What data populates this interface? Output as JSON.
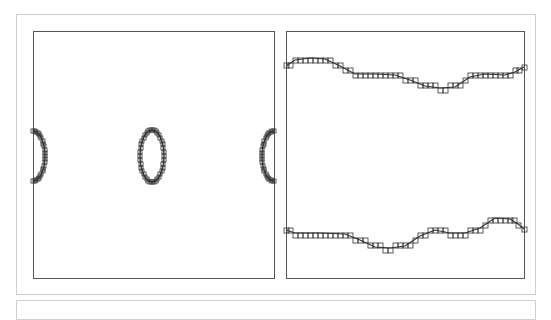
{
  "figure": {
    "panels": [
      {
        "id": "left",
        "description": "Contour panel showing closed cell-boundary outlines: a central ellipse and two half-arcs at the periodic left/right edges",
        "shapes": [
          {
            "type": "ellipse",
            "cx": 152,
            "cy": 156,
            "rx": 12,
            "ry": 26
          },
          {
            "type": "half-arc-left-edge",
            "x_edge": 33,
            "bulge_x": 45,
            "y_top": 131,
            "y_bottom": 181
          },
          {
            "type": "half-arc-right-edge",
            "x_edge": 274,
            "bulge_x": 262,
            "y_top": 131,
            "y_bottom": 181
          }
        ]
      },
      {
        "id": "right",
        "description": "Contour panel showing two wavy interface curves traced by staircase grid cells",
        "curves": [
          {
            "name": "upper-interface",
            "points": [
              [
                286,
                66
              ],
              [
                295,
                60
              ],
              [
                310,
                58
              ],
              [
                325,
                59
              ],
              [
                340,
                66
              ],
              [
                355,
                74
              ],
              [
                375,
                74
              ],
              [
                395,
                75
              ],
              [
                410,
                80
              ],
              [
                425,
                86
              ],
              [
                440,
                88
              ],
              [
                455,
                87
              ],
              [
                470,
                77
              ],
              [
                485,
                74
              ],
              [
                505,
                75
              ],
              [
                515,
                72
              ],
              [
                524,
                67
              ]
            ]
          },
          {
            "name": "lower-interface",
            "points": [
              [
                286,
                230
              ],
              [
                295,
                233
              ],
              [
                320,
                233
              ],
              [
                345,
                234
              ],
              [
                360,
                240
              ],
              [
                375,
                247
              ],
              [
                390,
                248
              ],
              [
                405,
                246
              ],
              [
                420,
                236
              ],
              [
                435,
                230
              ],
              [
                450,
                233
              ],
              [
                465,
                233
              ],
              [
                480,
                228
              ],
              [
                495,
                218
              ],
              [
                510,
                219
              ],
              [
                518,
                224
              ],
              [
                524,
                229
              ]
            ]
          }
        ]
      }
    ],
    "colors": {
      "frame": "#cfcfcf",
      "plot_border": "#555555",
      "curve": "#333333"
    }
  }
}
